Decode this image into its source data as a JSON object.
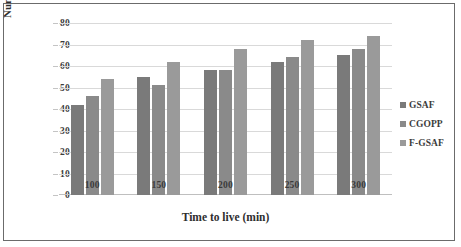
{
  "chart_data": {
    "type": "bar",
    "title": "",
    "xlabel": "Time to live (min)",
    "ylabel": "Number of dead nodes",
    "categories": [
      "100",
      "150",
      "200",
      "250",
      "300"
    ],
    "series": [
      {
        "name": "GSAF",
        "color": "#7a7a7a",
        "values": [
          42,
          55,
          58,
          62,
          65
        ]
      },
      {
        "name": "CGOPP",
        "color": "#8a8a8a",
        "values": [
          46,
          51,
          58,
          64,
          68
        ]
      },
      {
        "name": "F-GSAF",
        "color": "#9a9a9a",
        "values": [
          54,
          62,
          68,
          72,
          74
        ]
      }
    ],
    "ylim": [
      0,
      80
    ],
    "ytick_values": [
      "0",
      "10",
      "20",
      "30",
      "40",
      "50",
      "60",
      "70",
      "80"
    ],
    "grid": true,
    "legend_position": "right"
  },
  "figure": {
    "border_color": "#6b6b6b",
    "background": "#ffffff",
    "gridline_color": "#d9d9d9"
  }
}
